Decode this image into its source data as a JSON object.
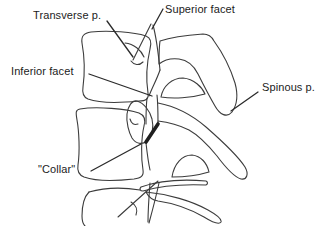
{
  "figure": {
    "colors": {
      "background": "#ffffff",
      "line": "#3c3c3c",
      "text": "#1c1c1c",
      "collar_mark": "#1f1f1f"
    },
    "labels": {
      "transverse": "Transverse p.",
      "superior": "Superior facet",
      "inferior": "Inferior facet",
      "spinous": "Spinous p.",
      "collar": "\"Collar\""
    }
  }
}
